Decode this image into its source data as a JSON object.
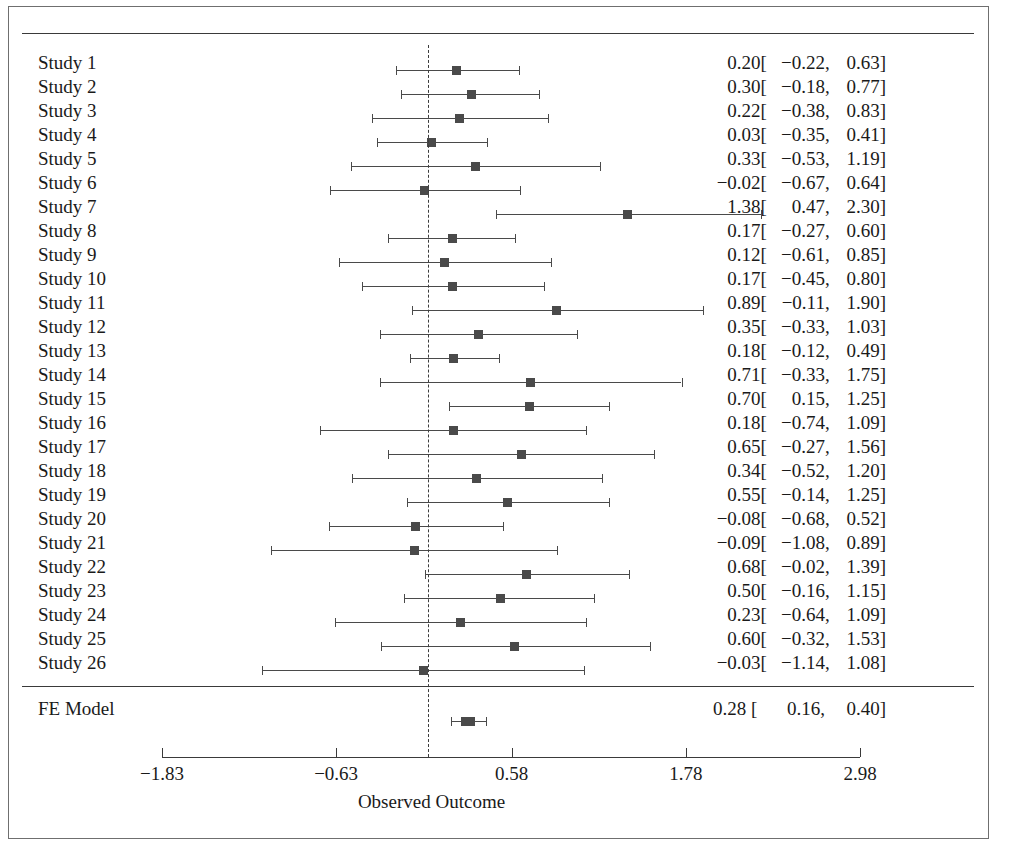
{
  "figure": {
    "credit": "© Cengage Learning 2014"
  },
  "axis": {
    "title": "Observed Outcome",
    "tick_labels": [
      "−1.83",
      "−0.63",
      "0.58",
      "1.78",
      "2.98"
    ]
  },
  "summary": {
    "label": "FE Model",
    "estimate": "0.28",
    "open_bracket": "[",
    "lower": "0.16",
    "comma": ",",
    "upper": "0.40",
    "close_bracket": "]"
  },
  "chart_data": {
    "type": "forest",
    "title": "",
    "xlabel": "Observed Outcome",
    "ylabel": "",
    "xlim": [
      -1.83,
      2.98
    ],
    "xticks": [
      -1.83,
      -0.63,
      0.58,
      1.78,
      2.98
    ],
    "xtick_labels": [
      "−1.83",
      "−0.63",
      "0.58",
      "1.78",
      "2.98"
    ],
    "reference_line": 0,
    "reference_line_style": "dashed",
    "grid": false,
    "legend": "none",
    "marker": "square",
    "colors": {
      "marker": "#4a4a4a",
      "line": "#4a4a4a",
      "rule": "#3a3a3a"
    },
    "studies": [
      {
        "label": "Study 1",
        "estimate": 0.2,
        "lower": -0.22,
        "upper": 0.63,
        "text": {
          "est": "0.20",
          "lo": "−0.22",
          "hi": "0.63"
        }
      },
      {
        "label": "Study 2",
        "estimate": 0.3,
        "lower": -0.18,
        "upper": 0.77,
        "text": {
          "est": "0.30",
          "lo": "−0.18",
          "hi": "0.77"
        }
      },
      {
        "label": "Study 3",
        "estimate": 0.22,
        "lower": -0.38,
        "upper": 0.83,
        "text": {
          "est": "0.22",
          "lo": "−0.38",
          "hi": "0.83"
        }
      },
      {
        "label": "Study 4",
        "estimate": 0.03,
        "lower": -0.35,
        "upper": 0.41,
        "text": {
          "est": "0.03",
          "lo": "−0.35",
          "hi": "0.41"
        }
      },
      {
        "label": "Study 5",
        "estimate": 0.33,
        "lower": -0.53,
        "upper": 1.19,
        "text": {
          "est": "0.33",
          "lo": "−0.53",
          "hi": "1.19"
        }
      },
      {
        "label": "Study 6",
        "estimate": -0.02,
        "lower": -0.67,
        "upper": 0.64,
        "text": {
          "est": "−0.02",
          "lo": "−0.67",
          "hi": "0.64"
        }
      },
      {
        "label": "Study 7",
        "estimate": 1.38,
        "lower": 0.47,
        "upper": 2.3,
        "text": {
          "est": "1.38",
          "lo": "0.47",
          "hi": "2.30"
        }
      },
      {
        "label": "Study 8",
        "estimate": 0.17,
        "lower": -0.27,
        "upper": 0.6,
        "text": {
          "est": "0.17",
          "lo": "−0.27",
          "hi": "0.60"
        }
      },
      {
        "label": "Study 9",
        "estimate": 0.12,
        "lower": -0.61,
        "upper": 0.85,
        "text": {
          "est": "0.12",
          "lo": "−0.61",
          "hi": "0.85"
        }
      },
      {
        "label": "Study 10",
        "estimate": 0.17,
        "lower": -0.45,
        "upper": 0.8,
        "text": {
          "est": "0.17",
          "lo": "−0.45",
          "hi": "0.80"
        }
      },
      {
        "label": "Study 11",
        "estimate": 0.89,
        "lower": -0.11,
        "upper": 1.9,
        "text": {
          "est": "0.89",
          "lo": "−0.11",
          "hi": "1.90"
        }
      },
      {
        "label": "Study 12",
        "estimate": 0.35,
        "lower": -0.33,
        "upper": 1.03,
        "text": {
          "est": "0.35",
          "lo": "−0.33",
          "hi": "1.03"
        }
      },
      {
        "label": "Study 13",
        "estimate": 0.18,
        "lower": -0.12,
        "upper": 0.49,
        "text": {
          "est": "0.18",
          "lo": "−0.12",
          "hi": "0.49"
        }
      },
      {
        "label": "Study 14",
        "estimate": 0.71,
        "lower": -0.33,
        "upper": 1.75,
        "text": {
          "est": "0.71",
          "lo": "−0.33",
          "hi": "1.75"
        }
      },
      {
        "label": "Study 15",
        "estimate": 0.7,
        "lower": 0.15,
        "upper": 1.25,
        "text": {
          "est": "0.70",
          "lo": "0.15",
          "hi": "1.25"
        }
      },
      {
        "label": "Study 16",
        "estimate": 0.18,
        "lower": -0.74,
        "upper": 1.09,
        "text": {
          "est": "0.18",
          "lo": "−0.74",
          "hi": "1.09"
        }
      },
      {
        "label": "Study 17",
        "estimate": 0.65,
        "lower": -0.27,
        "upper": 1.56,
        "text": {
          "est": "0.65",
          "lo": "−0.27",
          "hi": "1.56"
        }
      },
      {
        "label": "Study 18",
        "estimate": 0.34,
        "lower": -0.52,
        "upper": 1.2,
        "text": {
          "est": "0.34",
          "lo": "−0.52",
          "hi": "1.20"
        }
      },
      {
        "label": "Study 19",
        "estimate": 0.55,
        "lower": -0.14,
        "upper": 1.25,
        "text": {
          "est": "0.55",
          "lo": "−0.14",
          "hi": "1.25"
        }
      },
      {
        "label": "Study 20",
        "estimate": -0.08,
        "lower": -0.68,
        "upper": 0.52,
        "text": {
          "est": "−0.08",
          "lo": "−0.68",
          "hi": "0.52"
        }
      },
      {
        "label": "Study 21",
        "estimate": -0.09,
        "lower": -1.08,
        "upper": 0.89,
        "text": {
          "est": "−0.09",
          "lo": "−1.08",
          "hi": "0.89"
        }
      },
      {
        "label": "Study 22",
        "estimate": 0.68,
        "lower": -0.02,
        "upper": 1.39,
        "text": {
          "est": "0.68",
          "lo": "−0.02",
          "hi": "1.39"
        }
      },
      {
        "label": "Study 23",
        "estimate": 0.5,
        "lower": -0.16,
        "upper": 1.15,
        "text": {
          "est": "0.50",
          "lo": "−0.16",
          "hi": "1.15"
        }
      },
      {
        "label": "Study 24",
        "estimate": 0.23,
        "lower": -0.64,
        "upper": 1.09,
        "text": {
          "est": "0.23",
          "lo": "−0.64",
          "hi": "1.09"
        }
      },
      {
        "label": "Study 25",
        "estimate": 0.6,
        "lower": -0.32,
        "upper": 1.53,
        "text": {
          "est": "0.60",
          "lo": "−0.32",
          "hi": "1.53"
        }
      },
      {
        "label": "Study 26",
        "estimate": -0.03,
        "lower": -1.14,
        "upper": 1.08,
        "text": {
          "est": "−0.03",
          "lo": "−1.14",
          "hi": "1.08"
        }
      }
    ],
    "summary": {
      "label": "FE Model",
      "estimate": 0.28,
      "lower": 0.16,
      "upper": 0.4,
      "text": {
        "est": "0.28",
        "lo": "0.16",
        "hi": "0.40"
      }
    }
  }
}
